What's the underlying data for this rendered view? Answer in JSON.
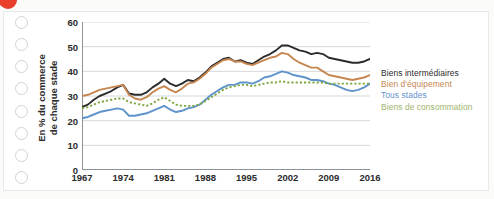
{
  "page": {
    "red_marker": "red-dot-marker"
  },
  "binder_holes": 8,
  "chart_data": {
    "type": "line",
    "title": "",
    "xlabel": "",
    "ylabel": "En % du commerce de chaque stade",
    "ylabel_line1": "En % du commerce",
    "ylabel_line2": "de chaque stade",
    "ylim": [
      0,
      60
    ],
    "yticks": [
      0,
      10,
      20,
      30,
      40,
      50,
      60
    ],
    "xlim": [
      1967,
      2016
    ],
    "xticks": [
      1967,
      1974,
      1981,
      1988,
      1995,
      2002,
      2009,
      2016
    ],
    "grid": "horizontal",
    "legend_position": "right",
    "x": [
      1967,
      1968,
      1969,
      1970,
      1971,
      1972,
      1973,
      1974,
      1975,
      1976,
      1977,
      1978,
      1979,
      1980,
      1981,
      1982,
      1983,
      1984,
      1985,
      1986,
      1987,
      1988,
      1989,
      1990,
      1991,
      1992,
      1993,
      1994,
      1995,
      1996,
      1997,
      1998,
      1999,
      2000,
      2001,
      2002,
      2003,
      2004,
      2005,
      2006,
      2007,
      2008,
      2009,
      2010,
      2011,
      2012,
      2013,
      2014,
      2015,
      2016
    ],
    "series": [
      {
        "name": "Biens intermédiaires",
        "color": "#2b2b2b",
        "style": "solid",
        "values": [
          25.5,
          26.5,
          28.5,
          30.0,
          31.0,
          32.0,
          33.5,
          34.5,
          31.0,
          30.5,
          30.5,
          31.5,
          33.5,
          35.0,
          37.0,
          35.0,
          34.0,
          35.0,
          36.5,
          36.0,
          37.5,
          39.5,
          42.0,
          43.5,
          45.0,
          45.5,
          44.0,
          44.5,
          43.5,
          43.0,
          44.5,
          46.0,
          47.0,
          48.5,
          50.5,
          50.5,
          49.5,
          48.5,
          48.0,
          47.0,
          47.5,
          47.0,
          45.5,
          45.0,
          44.5,
          44.0,
          43.5,
          43.5,
          44.0,
          45.0
        ]
      },
      {
        "name": "Bien d'équipement",
        "color": "#c6864f",
        "style": "solid",
        "values": [
          30.0,
          30.5,
          31.5,
          32.5,
          33.0,
          33.5,
          34.0,
          34.5,
          30.5,
          29.0,
          28.5,
          29.5,
          31.5,
          33.0,
          34.0,
          32.5,
          31.5,
          33.0,
          35.0,
          35.5,
          37.0,
          39.0,
          41.5,
          43.0,
          44.5,
          45.0,
          44.0,
          44.0,
          43.0,
          42.5,
          43.5,
          44.5,
          45.5,
          46.0,
          47.5,
          47.0,
          45.0,
          43.5,
          42.5,
          41.5,
          41.5,
          40.0,
          38.5,
          38.0,
          37.5,
          37.0,
          36.5,
          37.0,
          37.5,
          38.5
        ]
      },
      {
        "name": "Tous stades",
        "color": "#5f93cb",
        "style": "solid",
        "values": [
          21.0,
          21.5,
          22.5,
          23.5,
          24.0,
          24.5,
          25.0,
          24.5,
          22.0,
          22.0,
          22.5,
          23.0,
          24.0,
          25.0,
          26.0,
          24.5,
          23.5,
          24.0,
          25.0,
          25.5,
          26.5,
          28.5,
          30.5,
          32.0,
          33.5,
          34.5,
          34.5,
          35.5,
          35.5,
          35.0,
          36.0,
          37.5,
          38.0,
          39.0,
          40.0,
          39.5,
          38.5,
          38.0,
          37.5,
          36.5,
          36.5,
          36.0,
          35.0,
          34.5,
          33.5,
          32.5,
          32.0,
          32.5,
          33.5,
          35.0
        ]
      },
      {
        "name": "Biens de consommation",
        "color": "#7fa843",
        "style": "dotted",
        "values": [
          25.0,
          25.5,
          26.5,
          27.5,
          28.0,
          28.5,
          29.0,
          29.0,
          27.5,
          27.0,
          26.5,
          26.0,
          27.0,
          28.5,
          29.5,
          28.0,
          26.5,
          26.0,
          26.0,
          26.0,
          26.5,
          28.0,
          29.5,
          31.0,
          32.5,
          33.5,
          34.0,
          34.5,
          34.5,
          34.0,
          34.5,
          35.0,
          35.5,
          35.5,
          36.0,
          35.5,
          35.5,
          35.5,
          35.5,
          35.5,
          35.5,
          35.5,
          35.0,
          35.0,
          35.0,
          35.0,
          35.0,
          35.0,
          35.0,
          35.0
        ]
      }
    ],
    "legend": [
      {
        "label": "Biens intermédiaires",
        "color": "#2b2b2b"
      },
      {
        "label": "Bien d'équipement",
        "color": "#c6864f"
      },
      {
        "label": "Tous stades",
        "color": "#5f93cb"
      },
      {
        "label": "Biens de consommation",
        "color": "#9bb46a"
      }
    ]
  }
}
